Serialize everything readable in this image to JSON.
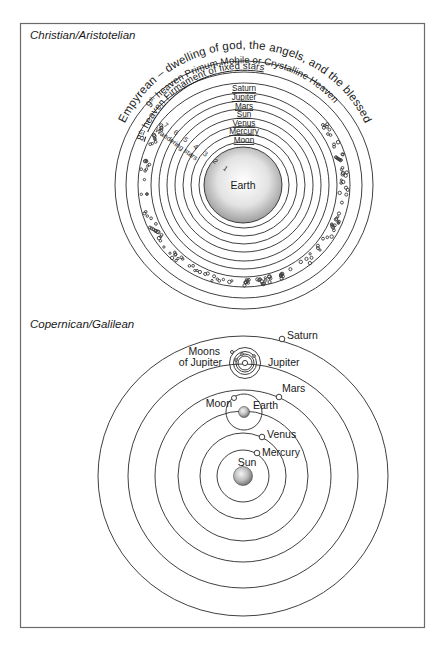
{
  "panels": {
    "top": {
      "title": "Christian/Aristotelian",
      "arc_labels": {
        "empyrean": "Empyrean – dwelling of god, the angels, and the blessed",
        "ninth_prefix": "9",
        "ninth_sup": "th",
        "ninth": " heaven Primum Mobile or Crystalline Heaven",
        "eighth_prefix": "8",
        "eighth_sup": "th",
        "eighth": " heaven Firmament of fixed stars",
        "wandering_numbers": "7 6 5 4 3 2 1",
        "wandering": "Wandering stars"
      },
      "spheres": [
        "Saturn",
        "Jupiter",
        "Mars",
        "Sun",
        "Venus",
        "Mercury",
        "Moon"
      ],
      "center": "Earth"
    },
    "bottom": {
      "title": "Copernican/Galilean",
      "labels": {
        "saturn": "Saturn",
        "moons_line1": "Moons",
        "moons_line2": "of Jupiter",
        "jupiter": "Jupiter",
        "mars": "Mars",
        "moon": "Moon",
        "earth": "Earth",
        "venus": "Venus",
        "mercury": "Mercury",
        "sun": "Sun"
      }
    }
  },
  "colors": {
    "frame": "#6b6b6b",
    "line": "#2a2a2a",
    "earth_fill_center": "#ffffff",
    "earth_fill_edge": "#9a9a9a"
  }
}
